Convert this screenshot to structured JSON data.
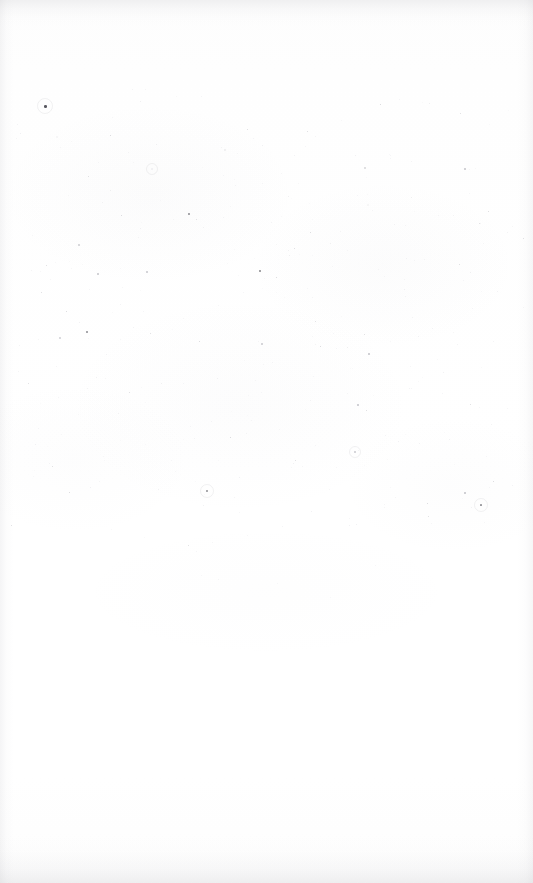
{
  "document": {
    "kind": "scanned-page",
    "page_label": "",
    "visible_text": "",
    "page_width": 533,
    "page_height": 883,
    "background_color": "#ffffff",
    "paper_tone": "#fdfdfd",
    "note": "Blank scanned page: no text, headings, figures or rules are rendered in the pixels."
  },
  "artifacts": {
    "speck_color_dark": "#4a4a52",
    "speck_color_mid": "#8e8e98",
    "speck_color_light": "#c3c3cb",
    "edge_shade_color": "#9a9aa2",
    "speck_field": {
      "top": 88,
      "bottom": 600,
      "left": 10,
      "right": 524,
      "peak_density_band": [
        150,
        420
      ],
      "approx_count": 430,
      "seed": 20947
    }
  },
  "specks": [
    {
      "x": 44,
      "y": 105,
      "s": 3.0,
      "t": 0.92,
      "halo": 7
    },
    {
      "x": 140,
      "y": 101,
      "s": 1.2,
      "t": 0.3
    },
    {
      "x": 201,
      "y": 96,
      "s": 1.0,
      "t": 0.24
    },
    {
      "x": 253,
      "y": 138,
      "s": 1.1,
      "t": 0.28
    },
    {
      "x": 307,
      "y": 131,
      "s": 1.3,
      "t": 0.34
    },
    {
      "x": 341,
      "y": 120,
      "s": 1.0,
      "t": 0.22
    },
    {
      "x": 380,
      "y": 104,
      "s": 1.4,
      "t": 0.4
    },
    {
      "x": 399,
      "y": 99,
      "s": 1.1,
      "t": 0.26
    },
    {
      "x": 429,
      "y": 103,
      "s": 1.2,
      "t": 0.3
    },
    {
      "x": 460,
      "y": 113,
      "s": 1.3,
      "t": 0.33
    },
    {
      "x": 464,
      "y": 168,
      "s": 1.5,
      "t": 0.46
    },
    {
      "x": 112,
      "y": 117,
      "s": 1.0,
      "t": 0.2
    },
    {
      "x": 60,
      "y": 147,
      "s": 1.1,
      "t": 0.24
    },
    {
      "x": 156,
      "y": 144,
      "s": 1.2,
      "t": 0.28
    },
    {
      "x": 88,
      "y": 176,
      "s": 1.3,
      "t": 0.33
    },
    {
      "x": 110,
      "y": 190,
      "s": 1.2,
      "t": 0.3
    },
    {
      "x": 121,
      "y": 215,
      "s": 1.4,
      "t": 0.38
    },
    {
      "x": 188,
      "y": 213,
      "s": 2.0,
      "t": 0.62
    },
    {
      "x": 196,
      "y": 219,
      "s": 1.3,
      "t": 0.32
    },
    {
      "x": 262,
      "y": 183,
      "s": 1.1,
      "t": 0.26
    },
    {
      "x": 288,
      "y": 196,
      "s": 1.2,
      "t": 0.3
    },
    {
      "x": 315,
      "y": 136,
      "s": 1.1,
      "t": 0.25
    },
    {
      "x": 355,
      "y": 155,
      "s": 1.2,
      "t": 0.29
    },
    {
      "x": 390,
      "y": 158,
      "s": 1.1,
      "t": 0.26
    },
    {
      "x": 411,
      "y": 197,
      "s": 1.2,
      "t": 0.3
    },
    {
      "x": 438,
      "y": 215,
      "s": 1.1,
      "t": 0.25
    },
    {
      "x": 469,
      "y": 193,
      "s": 1.0,
      "t": 0.22
    },
    {
      "x": 294,
      "y": 248,
      "s": 1.3,
      "t": 0.34
    },
    {
      "x": 330,
      "y": 243,
      "s": 1.2,
      "t": 0.3
    },
    {
      "x": 259,
      "y": 270,
      "s": 2.1,
      "t": 0.66
    },
    {
      "x": 276,
      "y": 277,
      "s": 1.4,
      "t": 0.38
    },
    {
      "x": 97,
      "y": 273,
      "s": 1.6,
      "t": 0.46
    },
    {
      "x": 146,
      "y": 271,
      "s": 1.5,
      "t": 0.43
    },
    {
      "x": 41,
      "y": 292,
      "s": 1.3,
      "t": 0.34
    },
    {
      "x": 66,
      "y": 311,
      "s": 1.4,
      "t": 0.38
    },
    {
      "x": 79,
      "y": 322,
      "s": 1.2,
      "t": 0.29
    },
    {
      "x": 38,
      "y": 339,
      "s": 1.1,
      "t": 0.25
    },
    {
      "x": 150,
      "y": 333,
      "s": 1.3,
      "t": 0.33
    },
    {
      "x": 183,
      "y": 318,
      "s": 1.1,
      "t": 0.24
    },
    {
      "x": 218,
      "y": 305,
      "s": 1.0,
      "t": 0.22
    },
    {
      "x": 261,
      "y": 343,
      "s": 1.5,
      "t": 0.42
    },
    {
      "x": 289,
      "y": 255,
      "s": 1.2,
      "t": 0.3
    },
    {
      "x": 312,
      "y": 297,
      "s": 1.1,
      "t": 0.25
    },
    {
      "x": 347,
      "y": 347,
      "s": 1.2,
      "t": 0.3
    },
    {
      "x": 368,
      "y": 353,
      "s": 1.6,
      "t": 0.48
    },
    {
      "x": 404,
      "y": 289,
      "s": 1.2,
      "t": 0.28
    },
    {
      "x": 424,
      "y": 259,
      "s": 1.1,
      "t": 0.25
    },
    {
      "x": 459,
      "y": 264,
      "s": 1.3,
      "t": 0.34
    },
    {
      "x": 470,
      "y": 272,
      "s": 1.2,
      "t": 0.3
    },
    {
      "x": 483,
      "y": 243,
      "s": 1.1,
      "t": 0.24
    },
    {
      "x": 497,
      "y": 291,
      "s": 1.2,
      "t": 0.28
    },
    {
      "x": 512,
      "y": 226,
      "s": 1.0,
      "t": 0.22
    },
    {
      "x": 28,
      "y": 383,
      "s": 1.3,
      "t": 0.33
    },
    {
      "x": 58,
      "y": 397,
      "s": 1.1,
      "t": 0.25
    },
    {
      "x": 96,
      "y": 377,
      "s": 1.2,
      "t": 0.29
    },
    {
      "x": 129,
      "y": 392,
      "s": 1.3,
      "t": 0.34
    },
    {
      "x": 161,
      "y": 383,
      "s": 1.2,
      "t": 0.3
    },
    {
      "x": 230,
      "y": 437,
      "s": 1.4,
      "t": 0.38
    },
    {
      "x": 239,
      "y": 477,
      "s": 1.2,
      "t": 0.29
    },
    {
      "x": 255,
      "y": 380,
      "s": 1.1,
      "t": 0.25
    },
    {
      "x": 293,
      "y": 463,
      "s": 1.2,
      "t": 0.28
    },
    {
      "x": 302,
      "y": 466,
      "s": 1.1,
      "t": 0.24
    },
    {
      "x": 336,
      "y": 467,
      "s": 1.0,
      "t": 0.22
    },
    {
      "x": 357,
      "y": 404,
      "s": 1.6,
      "t": 0.47
    },
    {
      "x": 366,
      "y": 410,
      "s": 1.3,
      "t": 0.33
    },
    {
      "x": 398,
      "y": 441,
      "s": 1.2,
      "t": 0.29
    },
    {
      "x": 411,
      "y": 388,
      "s": 1.1,
      "t": 0.25
    },
    {
      "x": 443,
      "y": 372,
      "s": 1.2,
      "t": 0.28
    },
    {
      "x": 470,
      "y": 404,
      "s": 1.3,
      "t": 0.33
    },
    {
      "x": 486,
      "y": 456,
      "s": 1.1,
      "t": 0.24
    },
    {
      "x": 35,
      "y": 444,
      "s": 1.2,
      "t": 0.28
    },
    {
      "x": 52,
      "y": 466,
      "s": 1.3,
      "t": 0.32
    },
    {
      "x": 69,
      "y": 492,
      "s": 1.4,
      "t": 0.38
    },
    {
      "x": 90,
      "y": 487,
      "s": 1.2,
      "t": 0.29
    },
    {
      "x": 99,
      "y": 481,
      "s": 1.1,
      "t": 0.25
    },
    {
      "x": 158,
      "y": 489,
      "s": 1.2,
      "t": 0.29
    },
    {
      "x": 171,
      "y": 460,
      "s": 1.1,
      "t": 0.24
    },
    {
      "x": 203,
      "y": 505,
      "s": 1.2,
      "t": 0.28
    },
    {
      "x": 188,
      "y": 545,
      "s": 1.3,
      "t": 0.32
    },
    {
      "x": 196,
      "y": 551,
      "s": 1.1,
      "t": 0.25
    },
    {
      "x": 212,
      "y": 542,
      "s": 1.0,
      "t": 0.21
    },
    {
      "x": 247,
      "y": 535,
      "s": 1.1,
      "t": 0.24
    },
    {
      "x": 295,
      "y": 460,
      "s": 1.3,
      "t": 0.33
    },
    {
      "x": 311,
      "y": 511,
      "s": 1.2,
      "t": 0.28
    },
    {
      "x": 349,
      "y": 518,
      "s": 1.1,
      "t": 0.24
    },
    {
      "x": 356,
      "y": 524,
      "s": 1.2,
      "t": 0.28
    },
    {
      "x": 395,
      "y": 497,
      "s": 1.1,
      "t": 0.25
    },
    {
      "x": 428,
      "y": 516,
      "s": 1.3,
      "t": 0.33
    },
    {
      "x": 431,
      "y": 523,
      "s": 1.1,
      "t": 0.24
    },
    {
      "x": 464,
      "y": 492,
      "s": 1.6,
      "t": 0.48
    },
    {
      "x": 471,
      "y": 507,
      "s": 1.2,
      "t": 0.29
    },
    {
      "x": 489,
      "y": 487,
      "s": 1.1,
      "t": 0.25
    },
    {
      "x": 206,
      "y": 490,
      "s": 2.0,
      "t": 0.6,
      "halo": 6
    },
    {
      "x": 480,
      "y": 504,
      "s": 1.9,
      "t": 0.58,
      "halo": 6
    },
    {
      "x": 375,
      "y": 565,
      "s": 1.0,
      "t": 0.2
    },
    {
      "x": 277,
      "y": 583,
      "s": 1.0,
      "t": 0.18
    },
    {
      "x": 330,
      "y": 597,
      "s": 1.0,
      "t": 0.16
    }
  ]
}
